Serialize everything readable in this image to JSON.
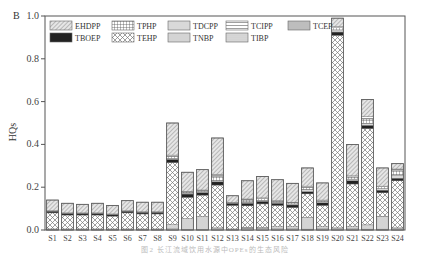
{
  "panel_label": "B",
  "caption": "图2  长江流域饮用水源中OPEs的生态风险",
  "chart_data": {
    "type": "bar",
    "stacked": true,
    "title": "",
    "xlabel": "",
    "ylabel": "HQs",
    "ylim": [
      0,
      1.0
    ],
    "yticks": [
      "0.0",
      "0.2",
      "0.4",
      "0.6",
      "0.8",
      "1.0"
    ],
    "grid": false,
    "legend_position": "top-inside",
    "legend": [
      "EHDPP",
      "TPHP",
      "TDCPP",
      "TCIPP",
      "TCEP",
      "TBOEP",
      "TEHP",
      "TNBP",
      "TIBP"
    ],
    "categories": [
      "S1",
      "S2",
      "S3",
      "S4",
      "S5",
      "S6",
      "S7",
      "S8",
      "S9",
      "S10",
      "S11",
      "S12",
      "S13",
      "S14",
      "S15",
      "S16",
      "S17",
      "S18",
      "S19",
      "S20",
      "S21",
      "S22",
      "S23",
      "S24"
    ],
    "series": [
      {
        "name": "TCEP",
        "values": [
          0.003,
          0.003,
          0.003,
          0.003,
          0.003,
          0.003,
          0.003,
          0.003,
          0.005,
          0.003,
          0.003,
          0.005,
          0.003,
          0.008,
          0.006,
          0.005,
          0.005,
          0.004,
          0.005,
          0.005,
          0.005,
          0.004,
          0.004,
          0.005
        ]
      },
      {
        "name": "TNBP",
        "values": [
          0.002,
          0.002,
          0.002,
          0.002,
          0.002,
          0.002,
          0.002,
          0.002,
          0.02,
          0.05,
          0.06,
          0.005,
          0.002,
          0.005,
          0.006,
          0.01,
          0.01,
          0.055,
          0.01,
          0.005,
          0.01,
          0.02,
          0.06,
          0.005
        ]
      },
      {
        "name": "TEHP",
        "values": [
          0.075,
          0.065,
          0.065,
          0.065,
          0.06,
          0.075,
          0.07,
          0.07,
          0.29,
          0.1,
          0.1,
          0.2,
          0.11,
          0.1,
          0.11,
          0.1,
          0.09,
          0.11,
          0.1,
          0.9,
          0.2,
          0.45,
          0.11,
          0.22
        ]
      },
      {
        "name": "TBOEP",
        "values": [
          0.008,
          0.008,
          0.008,
          0.008,
          0.008,
          0.008,
          0.008,
          0.008,
          0.015,
          0.015,
          0.012,
          0.015,
          0.01,
          0.012,
          0.012,
          0.01,
          0.012,
          0.01,
          0.012,
          0.015,
          0.015,
          0.015,
          0.012,
          0.012
        ]
      },
      {
        "name": "TDCPP",
        "values": [
          0.002,
          0.002,
          0.002,
          0.002,
          0.002,
          0.002,
          0.002,
          0.002,
          0.005,
          0.005,
          0.005,
          0.005,
          0.003,
          0.005,
          0.005,
          0.005,
          0.005,
          0.01,
          0.005,
          0.01,
          0.008,
          0.01,
          0.008,
          0.015
        ]
      },
      {
        "name": "TPHP",
        "values": [
          0.0,
          0.0,
          0.0,
          0.0,
          0.0,
          0.0,
          0.0,
          0.0,
          0.01,
          0.005,
          0.005,
          0.02,
          0.002,
          0.01,
          0.008,
          0.005,
          0.005,
          0.01,
          0.005,
          0.01,
          0.01,
          0.02,
          0.008,
          0.02
        ]
      },
      {
        "name": "TCIPP",
        "values": [
          0.0,
          0.0,
          0.0,
          0.0,
          0.0,
          0.0,
          0.0,
          0.0,
          0.005,
          0.002,
          0.002,
          0.01,
          0.0,
          0.005,
          0.003,
          0.002,
          0.003,
          0.006,
          0.003,
          0.005,
          0.005,
          0.01,
          0.003,
          0.008
        ]
      },
      {
        "name": "TIBP",
        "values": [
          0.0,
          0.0,
          0.0,
          0.0,
          0.0,
          0.0,
          0.0,
          0.0,
          0.0,
          0.0,
          0.0,
          0.0,
          0.0,
          0.0,
          0.0,
          0.0,
          0.0,
          0.0,
          0.0,
          0.0,
          0.0,
          0.0,
          0.0,
          0.0
        ]
      },
      {
        "name": "EHDPP",
        "values": [
          0.05,
          0.045,
          0.04,
          0.045,
          0.04,
          0.047,
          0.045,
          0.045,
          0.15,
          0.09,
          0.095,
          0.17,
          0.03,
          0.085,
          0.1,
          0.098,
          0.088,
          0.085,
          0.08,
          0.04,
          0.147,
          0.081,
          0.085,
          0.025
        ]
      }
    ],
    "totals": [
      0.14,
      0.125,
      0.12,
      0.125,
      0.115,
      0.135,
      0.13,
      0.13,
      0.5,
      0.27,
      0.28,
      0.43,
      0.16,
      0.23,
      0.25,
      0.24,
      0.22,
      0.29,
      0.22,
      0.99,
      0.4,
      0.61,
      0.29,
      0.31
    ]
  }
}
